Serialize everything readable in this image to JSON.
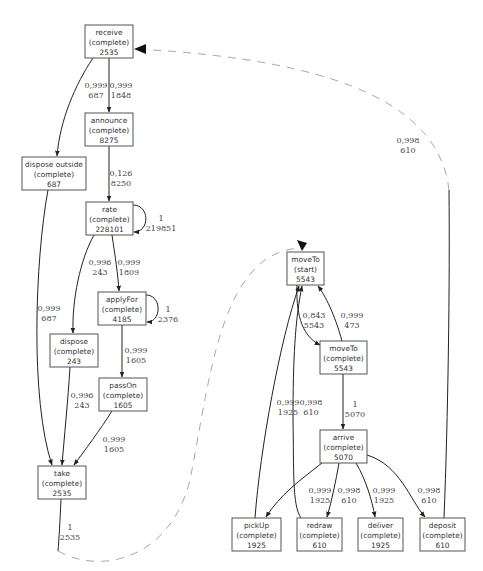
{
  "diagram": {
    "type": "process-model",
    "nodes": [
      {
        "id": "receive",
        "name": "receive",
        "type": "(complete)",
        "count": "2535",
        "x": 85,
        "y": 25,
        "w": 48,
        "h": 33
      },
      {
        "id": "announce",
        "name": "announce",
        "type": "(complete)",
        "count": "8275",
        "x": 85,
        "y": 113,
        "w": 48,
        "h": 33
      },
      {
        "id": "dispose_outside",
        "name": "dispose outside",
        "type": "(complete)",
        "count": "687",
        "x": 22,
        "y": 157,
        "w": 64,
        "h": 33
      },
      {
        "id": "rate",
        "name": "rate",
        "type": "(complete)",
        "count": "228101",
        "x": 86,
        "y": 202,
        "w": 47,
        "h": 33
      },
      {
        "id": "applyFor",
        "name": "applyFor",
        "type": "(complete)",
        "count": "4185",
        "x": 98,
        "y": 292,
        "w": 48,
        "h": 33
      },
      {
        "id": "dispose",
        "name": "dispose",
        "type": "(complete)",
        "count": "243",
        "x": 50,
        "y": 334,
        "w": 48,
        "h": 33
      },
      {
        "id": "passOn",
        "name": "passOn",
        "type": "(complete)",
        "count": "1605",
        "x": 99,
        "y": 378,
        "w": 48,
        "h": 33
      },
      {
        "id": "take",
        "name": "take",
        "type": "(complete)",
        "count": "2535",
        "x": 38,
        "y": 466,
        "w": 48,
        "h": 33
      },
      {
        "id": "moveTo_start",
        "name": "moveTo",
        "type": "(start)",
        "count": "5543",
        "x": 287,
        "y": 252,
        "w": 37,
        "h": 33
      },
      {
        "id": "moveTo_complete",
        "name": "moveTo",
        "type": "(complete)",
        "count": "5543",
        "x": 320,
        "y": 341,
        "w": 47,
        "h": 33
      },
      {
        "id": "arrive",
        "name": "arrive",
        "type": "(complete)",
        "count": "5070",
        "x": 320,
        "y": 430,
        "w": 47,
        "h": 33
      },
      {
        "id": "pickUp",
        "name": "pickUp",
        "type": "(complete)",
        "count": "1925",
        "x": 232,
        "y": 518,
        "w": 49,
        "h": 33
      },
      {
        "id": "redraw",
        "name": "redraw",
        "type": "(complete)",
        "count": "610",
        "x": 297,
        "y": 518,
        "w": 45,
        "h": 33
      },
      {
        "id": "deliver",
        "name": "deliver",
        "type": "(complete)",
        "count": "1925",
        "x": 358,
        "y": 518,
        "w": 45,
        "h": 33
      },
      {
        "id": "deposit",
        "name": "deposit",
        "type": "(complete)",
        "count": "610",
        "x": 420,
        "y": 518,
        "w": 45,
        "h": 33
      }
    ],
    "edges": [
      {
        "from": "receive",
        "to": "dispose_outside",
        "significance": "0,999",
        "frequency": "687",
        "lx": 96,
        "ly": 88
      },
      {
        "from": "receive",
        "to": "announce",
        "significance": "0,999",
        "frequency": "1848",
        "lx": 120,
        "ly": 88
      },
      {
        "from": "announce",
        "to": "rate",
        "significance": "0,126",
        "frequency": "8250",
        "lx": 120,
        "ly": 176
      },
      {
        "from": "rate",
        "to": "rate",
        "significance": "1",
        "frequency": "219851",
        "lx": 162,
        "ly": 222
      },
      {
        "from": "rate",
        "to": "dispose",
        "significance": "0,996",
        "frequency": "243",
        "lx": 100,
        "ly": 265
      },
      {
        "from": "rate",
        "to": "applyFor",
        "significance": "0,999",
        "frequency": "1809",
        "lx": 129,
        "ly": 265
      },
      {
        "from": "applyFor",
        "to": "applyFor",
        "significance": "1",
        "frequency": "2376",
        "lx": 168,
        "ly": 312
      },
      {
        "from": "dispose_outside",
        "to": "take",
        "significance": "0,999",
        "frequency": "687",
        "lx": 48,
        "ly": 311
      },
      {
        "from": "applyFor",
        "to": "passOn",
        "significance": "0,999",
        "frequency": "1605",
        "lx": 136,
        "ly": 353
      },
      {
        "from": "dispose",
        "to": "take",
        "significance": "0,996",
        "frequency": "243",
        "lx": 82,
        "ly": 398
      },
      {
        "from": "passOn",
        "to": "take",
        "significance": "0,999",
        "frequency": "1605",
        "lx": 114,
        "ly": 443
      },
      {
        "from": "take",
        "to": "moveTo_start",
        "significance": "1",
        "frequency": "2535",
        "lx": 70,
        "ly": 530,
        "style": "dashed"
      },
      {
        "from": "moveTo_start",
        "to": "moveTo_complete",
        "significance": "0,843",
        "frequency": "5543",
        "lx": 314,
        "ly": 318
      },
      {
        "from": "moveTo_complete",
        "to": "moveTo_start",
        "significance": "0,999",
        "frequency": "473",
        "lx": 352,
        "ly": 318
      },
      {
        "from": "moveTo_complete",
        "to": "arrive",
        "significance": "1",
        "frequency": "5070",
        "lx": 355,
        "ly": 407
      },
      {
        "from": "pickUp",
        "to": "moveTo_start",
        "significance": "0,999",
        "frequency": "1925",
        "lx": 288,
        "ly": 405
      },
      {
        "from": "redraw",
        "to": "moveTo_start",
        "significance": "0,998",
        "frequency": "610",
        "lx": 311,
        "ly": 405
      },
      {
        "from": "arrive",
        "to": "pickUp",
        "significance": "",
        "frequency": "",
        "lx": 0,
        "ly": 0
      },
      {
        "from": "arrive",
        "to": "redraw",
        "significance": "0,999",
        "frequency": "1925",
        "lx": 320,
        "ly": 493
      },
      {
        "from": "arrive",
        "to": "redraw_b",
        "significance": "0,998",
        "frequency": "610",
        "lx": 349,
        "ly": 493
      },
      {
        "from": "arrive",
        "to": "deliver",
        "significance": "0,999",
        "frequency": "1925",
        "lx": 384,
        "ly": 493
      },
      {
        "from": "arrive",
        "to": "deposit",
        "significance": "0,998",
        "frequency": "610",
        "lx": 429,
        "ly": 493
      },
      {
        "from": "deposit",
        "to": "receive",
        "significance": "0,998",
        "frequency": "610",
        "lx": 408,
        "ly": 143,
        "style": "dashed"
      }
    ]
  }
}
